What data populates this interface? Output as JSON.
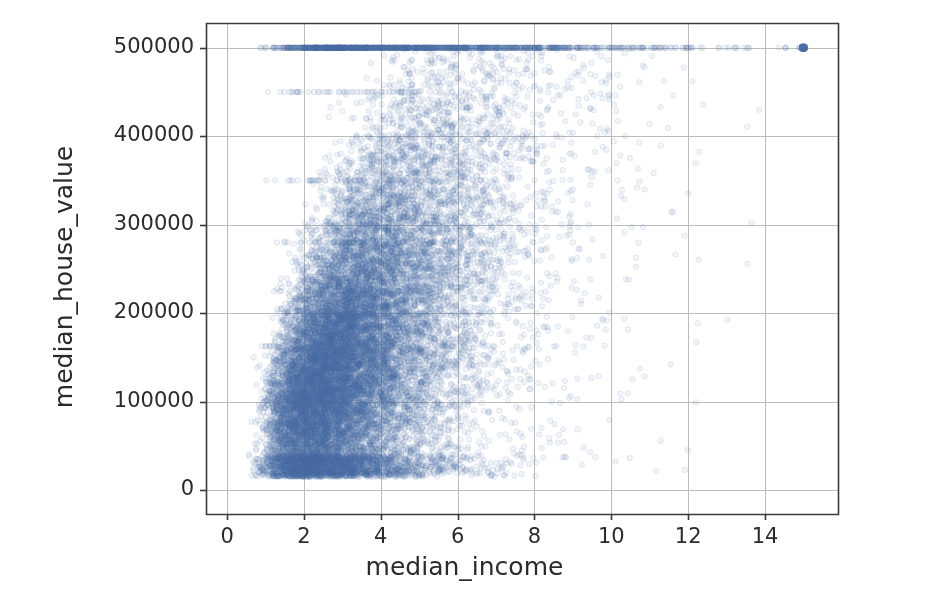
{
  "figure": {
    "background_color": "#ffffff",
    "frame_color": "#9a9a9a",
    "width": 929,
    "height": 596
  },
  "chart_data": {
    "type": "scatter",
    "title": "",
    "xlabel": "median_income",
    "ylabel": "median_house_value",
    "xlim": [
      -0.55,
      15.9
    ],
    "ylim": [
      -27000,
      528000
    ],
    "xticks": [
      0,
      2,
      4,
      6,
      8,
      10,
      12,
      14
    ],
    "xtick_labels": [
      "0",
      "2",
      "4",
      "6",
      "8",
      "10",
      "12",
      "14"
    ],
    "yticks": [
      0,
      100000,
      200000,
      300000,
      400000,
      500000
    ],
    "ytick_labels": [
      "0",
      "100000",
      "200000",
      "300000",
      "400000",
      "500000"
    ],
    "grid": true,
    "grid_color": "#bcbcbc",
    "axes_color": "#3a3a3a",
    "legend": null,
    "marker": {
      "shape": "circle",
      "size": 5.5,
      "facecolor": "#4a6fa5",
      "edgecolor": "#4a6fa5",
      "alpha": 0.08
    },
    "n_points": 20640,
    "correlation": 0.69,
    "distribution": {
      "x_lognormal_mu": 1.19,
      "x_lognormal_sigma": 0.46,
      "x_min": 0.5,
      "x_max": 15.0,
      "y_min": 14999,
      "y_max": 500001,
      "trend_intercept": 15000,
      "trend_slope": 42000,
      "noise_sigma": 62000,
      "cap_value": 500001,
      "cap_fraction": 0.047,
      "striation_levels": [
        450000,
        350000,
        280000,
        225000,
        162500,
        137500
      ],
      "striation_fraction": 0.012
    }
  },
  "axes_geometry": {
    "left": 206,
    "right": 838,
    "top": 23,
    "bottom": 514
  }
}
